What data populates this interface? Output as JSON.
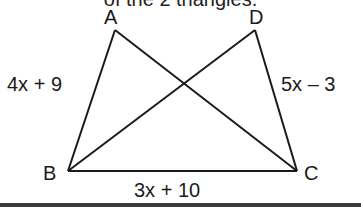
{
  "caption": "of the 2 triangles.",
  "diagram": {
    "vertices": {
      "A": {
        "label": "A",
        "x": 115,
        "y": 30
      },
      "D": {
        "label": "D",
        "x": 255,
        "y": 30
      },
      "B": {
        "label": "B",
        "x": 68,
        "y": 171
      },
      "C": {
        "label": "C",
        "x": 297,
        "y": 171
      }
    },
    "segments": [
      "AB",
      "AC",
      "DB",
      "DC",
      "BC"
    ],
    "side_labels": {
      "AB": "4x + 9",
      "DC": "5x – 3",
      "BC": "3x + 10"
    },
    "stroke_color": "#1a1a1a"
  }
}
